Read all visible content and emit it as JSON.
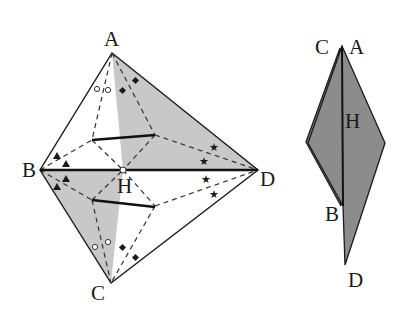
{
  "figure": {
    "left_diagram": {
      "labels": {
        "A": "A",
        "B": "B",
        "C": "C",
        "D": "D",
        "H": "H"
      },
      "vertices": {
        "A": [
          112,
          53
        ],
        "B": [
          40,
          170
        ],
        "C": [
          111,
          283
        ],
        "D": [
          258,
          170
        ],
        "H": [
          123,
          170
        ]
      },
      "shaded_regions": [
        "upper-right (A-H-D)",
        "lower-left (B-H-C)"
      ],
      "markers": [
        "open circles",
        "filled diamonds",
        "filled triangles",
        "stars"
      ]
    },
    "right_diagram": {
      "labels": {
        "C": "C",
        "A": "A",
        "H": "H",
        "B": "B",
        "D": "D"
      },
      "vertices": {
        "apex": [
          342,
          46
        ],
        "left": [
          308,
          143
        ],
        "right": [
          385,
          143
        ],
        "B": [
          343,
          206
        ],
        "D": [
          345,
          265
        ]
      }
    },
    "colors": {
      "shade": "#c8c8c8",
      "dark_shade": "#8c8c8c",
      "line": "#1a1a1a"
    }
  }
}
